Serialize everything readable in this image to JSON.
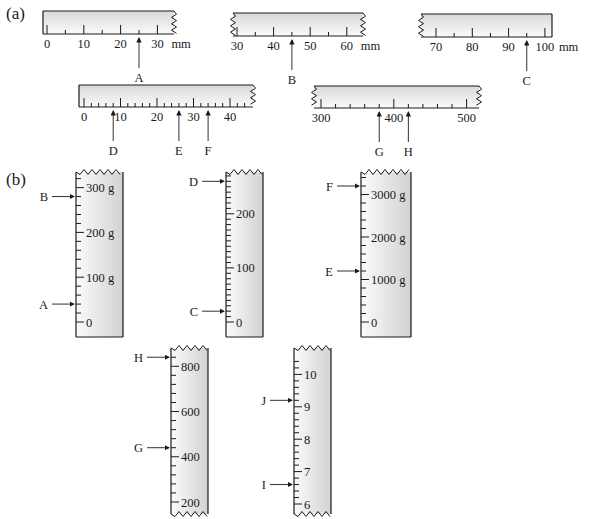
{
  "figure": {
    "part_a_label": "(a)",
    "part_b_label": "(b)",
    "unit_mm": "mm",
    "unit_g": "g"
  },
  "horizontal_rulers": [
    {
      "id": "ruler-1",
      "x": 43,
      "y": 11,
      "w": 131,
      "h": 23,
      "min": 0,
      "max": 35,
      "x0": 47,
      "pxPerUnit": 3.68,
      "minor": 5,
      "major": 10,
      "labels": [
        "0",
        "10",
        "20",
        "30"
      ],
      "labelValues": [
        0,
        10,
        20,
        30
      ],
      "unit": "mm",
      "torn": "right",
      "arrows": [
        {
          "label": "A",
          "value": 25
        }
      ]
    },
    {
      "id": "ruler-2",
      "x": 233,
      "y": 13,
      "w": 130,
      "h": 23,
      "min": 30,
      "max": 62,
      "x0": 237,
      "pxPerUnit": 3.66,
      "minor": 5,
      "major": 10,
      "labels": [
        "30",
        "40",
        "50",
        "60"
      ],
      "labelValues": [
        30,
        40,
        50,
        60
      ],
      "unit": "mm",
      "torn": "both",
      "arrows": [
        {
          "label": "B",
          "value": 45
        }
      ]
    },
    {
      "id": "ruler-3",
      "x": 421,
      "y": 14,
      "w": 131,
      "h": 23,
      "min": 66,
      "max": 100,
      "x0": 436,
      "pxPerUnit": 3.63,
      "minor": 5,
      "major": 10,
      "labels": [
        "70",
        "80",
        "90",
        "100"
      ],
      "labelValues": [
        70,
        80,
        90,
        100
      ],
      "unit": "mm",
      "torn": "left",
      "arrows": [
        {
          "label": "C",
          "value": 95
        }
      ]
    },
    {
      "id": "ruler-4",
      "x": 79,
      "y": 85,
      "w": 174,
      "h": 22,
      "min": 0,
      "max": 46,
      "x0": 84,
      "pxPerUnit": 3.65,
      "minor": 2,
      "major": 10,
      "labels": [
        "0",
        "10",
        "20",
        "30",
        "40"
      ],
      "labelValues": [
        0,
        10,
        20,
        30,
        40
      ],
      "unit": "",
      "torn": "right",
      "arrows": [
        {
          "label": "D",
          "value": 8
        },
        {
          "label": "E",
          "value": 26
        },
        {
          "label": "F",
          "value": 34
        }
      ]
    },
    {
      "id": "ruler-5",
      "x": 314,
      "y": 86,
      "w": 165,
      "h": 22,
      "min": 295,
      "max": 515,
      "x0": 321,
      "pxPerUnit": 0.728,
      "minor": 20,
      "major": 100,
      "labels": [
        "300",
        "400",
        "500"
      ],
      "labelValues": [
        300,
        400,
        500
      ],
      "unit": "",
      "torn": "both",
      "arrows": [
        {
          "label": "G",
          "value": 380
        },
        {
          "label": "H",
          "value": 420
        }
      ]
    }
  ],
  "vertical_scales": [
    {
      "id": "scale-1",
      "x": 76,
      "y": 172,
      "w": 47,
      "h": 165,
      "min": 0,
      "max": 325,
      "y0": 322,
      "pxPerUnit": 0.448,
      "minor": 20,
      "major": 100,
      "labels": [
        "0",
        "100 g",
        "200 g",
        "300 g"
      ],
      "labelValues": [
        0,
        100,
        200,
        300
      ],
      "torn": "top",
      "arrows": [
        {
          "label": "B",
          "value": 280
        },
        {
          "label": "A",
          "value": 40
        }
      ]
    },
    {
      "id": "scale-2",
      "x": 226,
      "y": 172,
      "w": 37,
      "h": 165,
      "min": 0,
      "max": 290,
      "y0": 322,
      "pxPerUnit": 0.541,
      "minor": 10,
      "major": 100,
      "labels": [
        "0",
        "100",
        "200"
      ],
      "labelValues": [
        0,
        100,
        200
      ],
      "torn": "top",
      "arrows": [
        {
          "label": "D",
          "value": 260
        },
        {
          "label": "C",
          "value": 20
        }
      ]
    },
    {
      "id": "scale-3",
      "x": 361,
      "y": 172,
      "w": 50,
      "h": 165,
      "min": 0,
      "max": 3600,
      "y0": 322,
      "pxPerUnit": 0.0425,
      "minor": 200,
      "major": 1000,
      "labels": [
        "0",
        "1000 g",
        "2000 g",
        "3000 g"
      ],
      "labelValues": [
        0,
        1000,
        2000,
        3000
      ],
      "torn": "top",
      "arrows": [
        {
          "label": "F",
          "value": 3200
        },
        {
          "label": "E",
          "value": 1200
        }
      ]
    },
    {
      "id": "scale-4",
      "x": 171,
      "y": 348,
      "w": 37,
      "h": 166,
      "min": 190,
      "max": 850,
      "y0": 502,
      "pxPerUnit": 0.2262,
      "minor": 40,
      "major": 200,
      "labels": [
        "200",
        "400",
        "600",
        "800"
      ],
      "labelValues": [
        200,
        400,
        600,
        800
      ],
      "torn": "both",
      "arrows": [
        {
          "label": "H",
          "value": 840
        },
        {
          "label": "G",
          "value": 440
        }
      ]
    },
    {
      "id": "scale-5",
      "x": 294,
      "y": 348,
      "w": 37,
      "h": 166,
      "min": 5.9,
      "max": 10.4,
      "y0": 504,
      "pxPerUnit": 32.4,
      "minor": 0.2,
      "major": 1,
      "labels": [
        "6",
        "7",
        "8",
        "9",
        "10"
      ],
      "labelValues": [
        6,
        7,
        8,
        9,
        10
      ],
      "torn": "both",
      "arrows": [
        {
          "label": "J",
          "value": 9.2
        },
        {
          "label": "I",
          "value": 6.6
        }
      ]
    }
  ],
  "colors": {
    "ink": "#1a1a1a",
    "fill_light": "#fbfbfb",
    "fill_dark": "#dcdcdc"
  }
}
